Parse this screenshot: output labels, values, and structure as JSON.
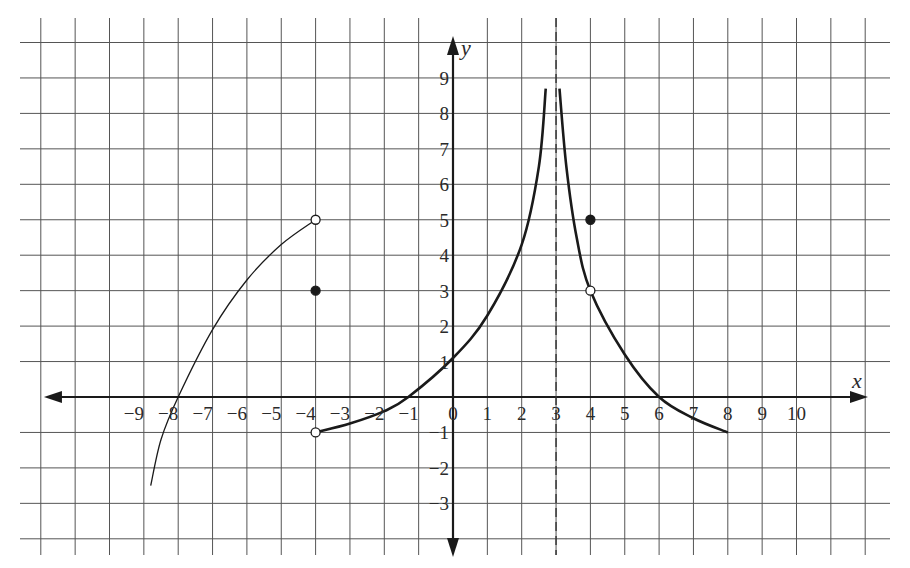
{
  "chart_data": {
    "type": "line",
    "title": "",
    "xlabel": "x",
    "ylabel": "y",
    "xlim": [
      -12,
      12
    ],
    "ylim": [
      -4,
      10
    ],
    "grid": true,
    "x_ticks": [
      "-9",
      "-8",
      "-7",
      "-6",
      "-5",
      "-4",
      "-3",
      "-2",
      "-1",
      "0",
      "1",
      "2",
      "3",
      "4",
      "5",
      "6",
      "7",
      "8",
      "9",
      "10"
    ],
    "y_ticks": [
      "9",
      "8",
      "7",
      "6",
      "5",
      "4",
      "3",
      "2",
      "1",
      "-1",
      "-2",
      "-3"
    ],
    "asymptote": {
      "type": "vertical",
      "x": 3,
      "style": "dashed"
    },
    "series": [
      {
        "name": "left-branch",
        "description": "increasing curve from (-8.8,-2.5) through (-8,0) to open circle at (-4,5)",
        "points": [
          [
            -8.8,
            -2.5
          ],
          [
            -8.5,
            -1.2
          ],
          [
            -8,
            0
          ],
          [
            -7,
            1.9
          ],
          [
            -6,
            3.3
          ],
          [
            -5,
            4.3
          ],
          [
            -4,
            5
          ]
        ]
      },
      {
        "name": "middle-branch",
        "description": "from open circle (-4,-1) rising through (-1.3,0),(0,1.1) to vertical asymptote x=3",
        "points": [
          [
            -4,
            -1
          ],
          [
            -3,
            -0.75
          ],
          [
            -2,
            -0.4
          ],
          [
            -1.3,
            0
          ],
          [
            0,
            1.1
          ],
          [
            1,
            2.3
          ],
          [
            2,
            4.3
          ],
          [
            2.5,
            6.5
          ],
          [
            2.7,
            8.7
          ]
        ]
      },
      {
        "name": "right-branch",
        "description": "from vertical asymptote x=3 decreasing through (4,3),(6,0) to endpoint (8,-1)",
        "points": [
          [
            3.1,
            8.7
          ],
          [
            3.3,
            6.5
          ],
          [
            3.6,
            4.5
          ],
          [
            4,
            3
          ],
          [
            5,
            1.2
          ],
          [
            6,
            0
          ],
          [
            7,
            -0.6
          ],
          [
            8,
            -1
          ]
        ]
      }
    ],
    "marked_points": [
      {
        "x": -4,
        "y": 5,
        "type": "open"
      },
      {
        "x": -4,
        "y": 3,
        "type": "closed"
      },
      {
        "x": -4,
        "y": -1,
        "type": "open"
      },
      {
        "x": 4,
        "y": 5,
        "type": "closed"
      },
      {
        "x": 4,
        "y": 3,
        "type": "open"
      }
    ]
  },
  "labels": {
    "x_axis": "x",
    "y_axis": "y"
  }
}
